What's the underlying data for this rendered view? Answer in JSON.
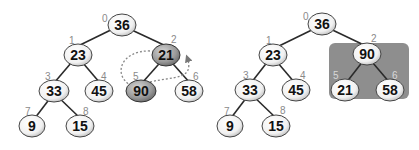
{
  "diagram": {
    "before": {
      "nodes": [
        {
          "index": "0",
          "value": "36",
          "highlight": false
        },
        {
          "index": "1",
          "value": "23",
          "highlight": false
        },
        {
          "index": "2",
          "value": "21",
          "highlight": true
        },
        {
          "index": "3",
          "value": "33",
          "highlight": false
        },
        {
          "index": "4",
          "value": "45",
          "highlight": false
        },
        {
          "index": "5",
          "value": "90",
          "highlight": true
        },
        {
          "index": "6",
          "value": "58",
          "highlight": false
        },
        {
          "index": "7",
          "value": "9",
          "highlight": false
        },
        {
          "index": "8",
          "value": "15",
          "highlight": false
        }
      ],
      "swap": {
        "from_index": "2",
        "to_index": "5",
        "style": "dotted-arrows"
      }
    },
    "after": {
      "nodes": [
        {
          "index": "0",
          "value": "36"
        },
        {
          "index": "1",
          "value": "23"
        },
        {
          "index": "2",
          "value": "90"
        },
        {
          "index": "3",
          "value": "33"
        },
        {
          "index": "4",
          "value": "45"
        },
        {
          "index": "5",
          "value": "21"
        },
        {
          "index": "6",
          "value": "58"
        },
        {
          "index": "7",
          "value": "9"
        },
        {
          "index": "8",
          "value": "15"
        }
      ],
      "highlighted_subtree_root_index": "2",
      "highlight_color": "#8e8e8e"
    },
    "colors": {
      "node_fill_light": "#ffffff",
      "node_fill_highlight": "#9a9a9a",
      "edge": "#2a2a2a",
      "index_label": "#8a8a8a",
      "subtree_box": "#8e8e8e"
    }
  }
}
